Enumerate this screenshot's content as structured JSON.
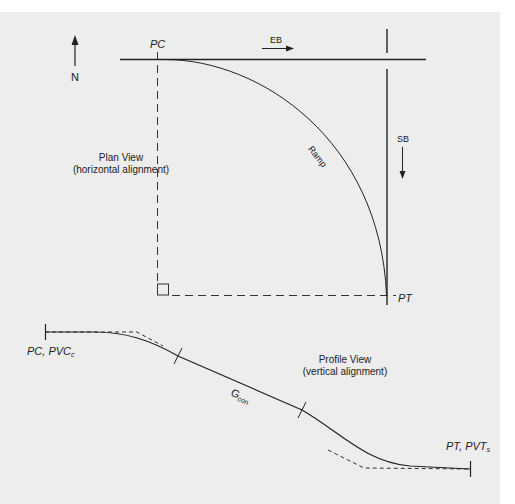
{
  "diagram": {
    "type": "highway-ramp-alignment",
    "colors": {
      "background": "#ededed",
      "page": "#ffffff",
      "line": "#222222"
    },
    "plan_view": {
      "title": "Plan View",
      "subtitle": "(horizontal alignment)",
      "north_label": "N",
      "pc_label": "PC",
      "pt_label": "PT",
      "eb_label": "EB",
      "sb_label": "SB",
      "ramp_label": "Ramp"
    },
    "profile_view": {
      "title": "Profile View",
      "subtitle": "(vertical alignment)",
      "start_label_main": "PC, PVC",
      "start_label_sub": "c",
      "end_label_main": "PT, PVT",
      "end_label_sub": "s",
      "grade_label_main": "G",
      "grade_label_sub": "con"
    }
  }
}
